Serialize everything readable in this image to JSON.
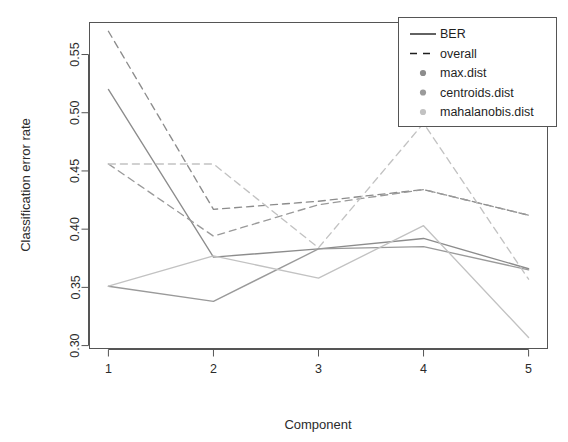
{
  "chart_data": {
    "type": "line",
    "title": "",
    "xlabel": "Component",
    "ylabel": "Classification error rate",
    "x": [
      1,
      2,
      3,
      4,
      5
    ],
    "categories": [
      "1",
      "2",
      "3",
      "4",
      "5"
    ],
    "xtick_labels": [
      "1",
      "2",
      "3",
      "4",
      "5"
    ],
    "ytick_labels": [
      "0.30",
      "0.35",
      "0.40",
      "0.45",
      "0.50",
      "0.55"
    ],
    "ytick_values": [
      0.3,
      0.35,
      0.4,
      0.45,
      0.5,
      0.55
    ],
    "xlim": [
      0.82,
      5.18
    ],
    "ylim": [
      0.2975,
      0.5775
    ],
    "grid": false,
    "legend_position": "top-right",
    "series": [
      {
        "name": "max.dist BER",
        "distance": "max.dist",
        "measure": "BER",
        "linestyle": "solid",
        "color": "#8c8c8c",
        "values": [
          0.52,
          0.376,
          0.383,
          0.392,
          0.366
        ]
      },
      {
        "name": "centroids.dist BER",
        "distance": "centroids.dist",
        "measure": "BER",
        "linestyle": "solid",
        "color": "#9a9a9a",
        "values": [
          0.351,
          0.338,
          0.383,
          0.385,
          0.365
        ]
      },
      {
        "name": "mahalanobis.dist BER",
        "distance": "mahalanobis.dist",
        "measure": "BER",
        "linestyle": "solid",
        "color": "#c2c2c2",
        "values": [
          0.351,
          0.377,
          0.358,
          0.403,
          0.307
        ]
      },
      {
        "name": "max.dist overall",
        "distance": "max.dist",
        "measure": "overall",
        "linestyle": "dashed",
        "color": "#8c8c8c",
        "values": [
          0.57,
          0.417,
          0.424,
          0.434,
          0.412
        ]
      },
      {
        "name": "centroids.dist overall",
        "distance": "centroids.dist",
        "measure": "overall",
        "linestyle": "dashed",
        "color": "#9a9a9a",
        "values": [
          0.456,
          0.394,
          0.421,
          0.434,
          0.412
        ]
      },
      {
        "name": "mahalanobis.dist overall",
        "distance": "mahalanobis.dist",
        "measure": "overall",
        "linestyle": "dashed",
        "color": "#c2c2c2",
        "values": [
          0.456,
          0.456,
          0.384,
          0.491,
          0.357
        ]
      }
    ],
    "legend": {
      "entries": [
        {
          "label": "BER",
          "type": "solid-line",
          "color": "#1f1f1f"
        },
        {
          "label": "overall",
          "type": "dashed-line",
          "color": "#1f1f1f"
        },
        {
          "label": "max.dist",
          "type": "dot",
          "color": "#8c8c8c"
        },
        {
          "label": "centroids.dist",
          "type": "dot",
          "color": "#9a9a9a"
        },
        {
          "label": "mahalanobis.dist",
          "type": "dot",
          "color": "#c2c2c2"
        }
      ]
    }
  }
}
